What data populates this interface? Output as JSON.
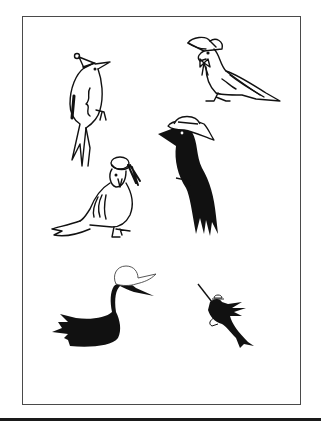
{
  "page": {
    "colors": {
      "ink": "#111111",
      "frame": "#4a4a4a",
      "paper": "#ffffff",
      "bar": "#1a1a1a"
    }
  },
  "illustrations": [
    {
      "id": "woodpecker",
      "label": "Outlined woodpecker in pom-pom cap",
      "style": "outline"
    },
    {
      "id": "pigeon",
      "label": "Outlined pigeon in bonnet with bow",
      "style": "outline"
    },
    {
      "id": "crow",
      "label": "Black crow in straw hat",
      "style": "silhouette"
    },
    {
      "id": "parrot",
      "label": "Outlined long-tailed bird in boater hat",
      "style": "outline"
    },
    {
      "id": "duck",
      "label": "Black duck in white cap",
      "style": "silhouette"
    },
    {
      "id": "hummingbird",
      "label": "Black hummingbird with small hat",
      "style": "silhouette"
    }
  ]
}
